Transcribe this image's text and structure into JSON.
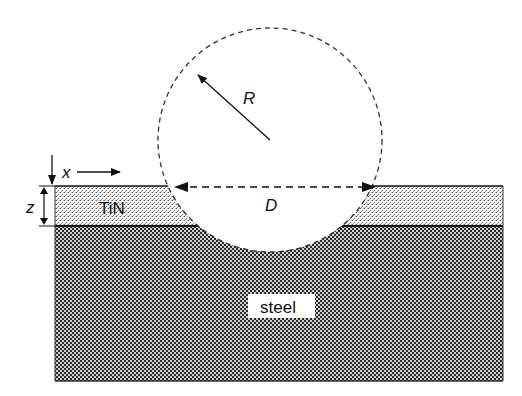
{
  "diagram": {
    "type": "cross-section schematic",
    "labels": {
      "radius": "R",
      "diameter": "D",
      "x_axis": "x",
      "z_axis": "z",
      "coating": "TiN",
      "substrate": "steel"
    },
    "layers": [
      {
        "name": "coating",
        "label": "TiN",
        "pattern": "fine-stipple"
      },
      {
        "name": "substrate",
        "label": "steel",
        "pattern": "checkered"
      }
    ],
    "colors": {
      "line": "#111111",
      "background": "#ffffff",
      "dash": "#333333"
    }
  }
}
